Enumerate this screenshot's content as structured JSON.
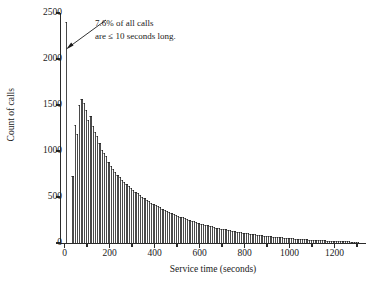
{
  "figure": {
    "background": "#ffffff",
    "bar_color": "#4a4a4a",
    "axis_color": "#2b2b2b"
  },
  "annotation": {
    "line1": "7.6% of all calls",
    "line2": "are ≤ 10 seconds long."
  },
  "chart_data": {
    "type": "bar",
    "title": "",
    "subtitle": "",
    "xlabel": "Service time (seconds)",
    "ylabel": "Count of calls",
    "xlim": [
      -20,
      1340
    ],
    "ylim": [
      0,
      2500
    ],
    "xticks": [
      0,
      200,
      400,
      600,
      800,
      1000,
      1200
    ],
    "xtick_labels": [
      "0",
      "200",
      "400",
      "600",
      "800",
      "1000",
      "1200"
    ],
    "yticks": [
      0,
      500,
      1000,
      1500,
      2000,
      2500
    ],
    "ytick_labels": [
      "0",
      "500",
      "1000",
      "1500",
      "2000",
      "2500"
    ],
    "grid": false,
    "legend": null,
    "bin_width": 10,
    "bin_starts": [
      0,
      10,
      20,
      30,
      40,
      50,
      60,
      70,
      80,
      90,
      100,
      110,
      120,
      130,
      140,
      150,
      160,
      170,
      180,
      190,
      200,
      210,
      220,
      230,
      240,
      250,
      260,
      270,
      280,
      290,
      300,
      310,
      320,
      330,
      340,
      350,
      360,
      370,
      380,
      390,
      400,
      410,
      420,
      430,
      440,
      450,
      460,
      470,
      480,
      490,
      500,
      510,
      520,
      530,
      540,
      550,
      560,
      570,
      580,
      590,
      600,
      610,
      620,
      630,
      640,
      650,
      660,
      670,
      680,
      690,
      700,
      710,
      720,
      730,
      740,
      750,
      760,
      770,
      780,
      790,
      800,
      810,
      820,
      830,
      840,
      850,
      860,
      870,
      880,
      890,
      900,
      910,
      920,
      930,
      940,
      950,
      960,
      970,
      980,
      990,
      1000,
      1010,
      1020,
      1030,
      1040,
      1050,
      1060,
      1070,
      1080,
      1090,
      1100,
      1110,
      1120,
      1130,
      1140,
      1150,
      1160,
      1170,
      1180,
      1190,
      1200,
      1210,
      1220,
      1230,
      1240,
      1250,
      1260,
      1270,
      1280,
      1290,
      1300
    ],
    "values": [
      2400,
      0,
      0,
      730,
      1280,
      1190,
      1500,
      1560,
      1520,
      1450,
      1340,
      1380,
      1270,
      1210,
      1160,
      1090,
      1010,
      980,
      950,
      880,
      840,
      800,
      770,
      740,
      720,
      690,
      660,
      640,
      620,
      600,
      575,
      555,
      540,
      520,
      505,
      490,
      470,
      455,
      440,
      425,
      415,
      400,
      388,
      375,
      362,
      350,
      340,
      330,
      318,
      308,
      298,
      288,
      278,
      268,
      260,
      250,
      242,
      235,
      228,
      220,
      212,
      205,
      198,
      192,
      186,
      180,
      174,
      168,
      162,
      157,
      152,
      147,
      142,
      137,
      132,
      128,
      124,
      120,
      116,
      112,
      108,
      104,
      100,
      97,
      94,
      90,
      87,
      84,
      81,
      78,
      75,
      72,
      70,
      67,
      65,
      62,
      60,
      58,
      56,
      54,
      52,
      50,
      48,
      46,
      44,
      42,
      41,
      39,
      38,
      36,
      35,
      33,
      32,
      31,
      30,
      28,
      27,
      26,
      25,
      24,
      23,
      22,
      21,
      20,
      19,
      18,
      17,
      16,
      15,
      14,
      13,
      12,
      11,
      10
    ],
    "annotations": [
      {
        "text": "7.6% of all calls are ≤ 10 seconds long.",
        "points_to_bin": 0,
        "points_to_value": 2400
      }
    ]
  }
}
